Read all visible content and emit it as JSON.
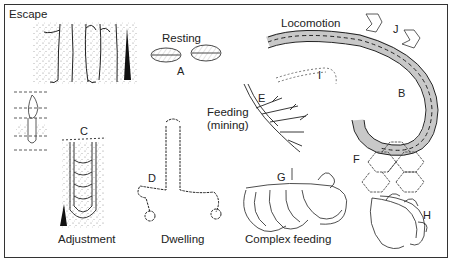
{
  "figure": {
    "categories": {
      "escape": "Escape",
      "resting": "Resting",
      "locomotion": "Locomotion",
      "feeding_mining_line1": "Feeding",
      "feeding_mining_line2": "(mining)",
      "adjustment": "Adjustment",
      "dwelling": "Dwelling",
      "complex_feeding": "Complex feeding"
    },
    "letters": {
      "A": "A",
      "B": "B",
      "C": "C",
      "D": "D",
      "E": "E",
      "F": "F",
      "G": "G",
      "H": "H",
      "I": "I",
      "J": "J"
    },
    "colors": {
      "ink": "#222222",
      "sediment": "#9a9a9a",
      "background": "#ffffff"
    }
  }
}
